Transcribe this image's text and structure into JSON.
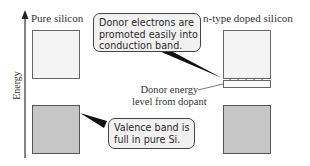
{
  "axis": {
    "label": "Energy"
  },
  "columns": {
    "left": {
      "title": "Pure silicon"
    },
    "right": {
      "title": "n-type doped silicon"
    }
  },
  "bands": {
    "conduction": {
      "fill": "#f4f4f4"
    },
    "valence": {
      "fill": "#c6c6c6"
    },
    "donor_level": {
      "electron_count": 5
    }
  },
  "callouts": {
    "donor": {
      "lines": [
        "Donor electrons are",
        "promoted easily into",
        "conduction band."
      ]
    },
    "valence": {
      "lines": [
        "Valence band is",
        "full in pure Si."
      ]
    }
  },
  "annotations": {
    "donor_level": {
      "lines": [
        "Donor energy",
        "level from dopant"
      ]
    }
  }
}
